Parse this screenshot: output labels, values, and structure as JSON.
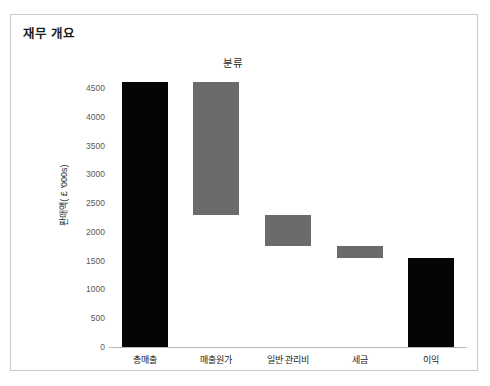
{
  "panel": {
    "header": "재무 개요"
  },
  "chart_data": {
    "type": "bar",
    "subtype": "waterfall",
    "title": "분류",
    "xlabel": "",
    "ylabel": "판매액( £ '000s)",
    "categories": [
      "총매출",
      "매출원가",
      "일반 관리비",
      "세금",
      "이익"
    ],
    "values": [
      4600,
      -2300,
      -550,
      -200,
      1550
    ],
    "bar_spans": [
      {
        "category": "총매출",
        "start": 0,
        "end": 4600,
        "kind": "total",
        "color": "#050505"
      },
      {
        "category": "매출원가",
        "start": 4600,
        "end": 2300,
        "kind": "decrease",
        "color": "#6b6b6b"
      },
      {
        "category": "일반 관리비",
        "start": 2300,
        "end": 1750,
        "kind": "decrease",
        "color": "#6b6b6b"
      },
      {
        "category": "세금",
        "start": 1750,
        "end": 1550,
        "kind": "decrease",
        "color": "#6b6b6b"
      },
      {
        "category": "이익",
        "start": 0,
        "end": 1550,
        "kind": "total",
        "color": "#050505"
      }
    ],
    "ylim": [
      0,
      4750
    ],
    "yticks": [
      0,
      500,
      1000,
      1500,
      2000,
      2500,
      3000,
      3500,
      4000,
      4500
    ],
    "ytick_labels": [
      "0",
      "500",
      "1000",
      "1500",
      "2000",
      "2500",
      "3000",
      "3500",
      "4000",
      "4500"
    ],
    "grid": false,
    "legend": null,
    "colors": {
      "total": "#050505",
      "decrease": "#6b6b6b",
      "axis": "#b8b8b8",
      "tick_text": "#5a5a5a",
      "panel_border": "#c9c9c9",
      "background": "#ffffff"
    }
  }
}
